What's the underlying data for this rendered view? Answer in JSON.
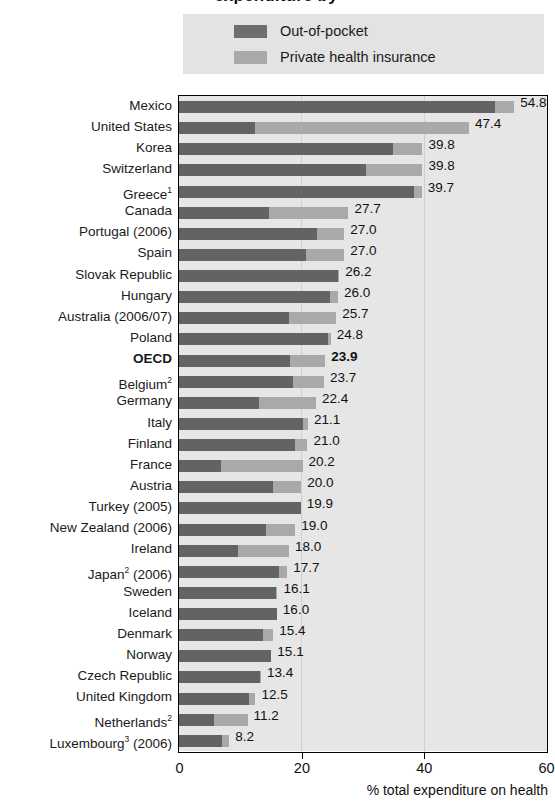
{
  "title": "expenditure by",
  "legend": {
    "position": "top",
    "items": [
      {
        "label": "Out-of-pocket",
        "color": "#636363",
        "icon": "legend-swatch"
      },
      {
        "label": "Private health insurance",
        "color": "#a9a9a9",
        "icon": "legend-swatch"
      }
    ]
  },
  "axis": {
    "xlabel": "% total expenditure on health",
    "ticks": [
      "0",
      "20",
      "40",
      "60"
    ],
    "xmin": 0,
    "xmax": 60
  },
  "chart_data": {
    "type": "bar",
    "orientation": "horizontal",
    "stacked": true,
    "title": "expenditure by",
    "xlabel": "% total expenditure on health",
    "ylabel": "",
    "xlim": [
      0,
      60
    ],
    "grid": true,
    "legend_position": "top",
    "series": [
      {
        "name": "Out-of-pocket",
        "color": "#636363"
      },
      {
        "name": "Private health insurance",
        "color": "#a9a9a9"
      }
    ],
    "categories": [
      "Mexico",
      "United States",
      "Korea",
      "Switzerland",
      "Greece¹",
      "Canada",
      "Portugal (2006)",
      "Spain",
      "Slovak Republic",
      "Hungary",
      "Australia (2006/07)",
      "Poland",
      "OECD",
      "Belgium²",
      "Germany",
      "Italy",
      "Finland",
      "France",
      "Austria",
      "Turkey (2005)",
      "New Zealand (2006)",
      "Ireland",
      "Japan² (2006)",
      "Sweden",
      "Iceland",
      "Denmark",
      "Norway",
      "Czech Republic",
      "United Kingdom",
      "Netherlands²",
      "Luxembourg³ (2006)"
    ],
    "rows": [
      {
        "label": "Mexico",
        "label_html": "Mexico",
        "out_of_pocket": 51.7,
        "private_insurance": 3.1,
        "total": "54.8",
        "bold": false
      },
      {
        "label": "United States",
        "label_html": "United States",
        "out_of_pocket": 12.5,
        "private_insurance": 34.9,
        "total": "47.4",
        "bold": false
      },
      {
        "label": "Korea",
        "label_html": "Korea",
        "out_of_pocket": 35.0,
        "private_insurance": 4.8,
        "total": "39.8",
        "bold": false
      },
      {
        "label": "Switzerland",
        "label_html": "Switzerland",
        "out_of_pocket": 30.5,
        "private_insurance": 9.3,
        "total": "39.8",
        "bold": false
      },
      {
        "label": "Greece1",
        "label_html": "Greece<sup>1</sup>",
        "out_of_pocket": 38.4,
        "private_insurance": 1.3,
        "total": "39.7",
        "bold": false
      },
      {
        "label": "Canada",
        "label_html": "Canada",
        "out_of_pocket": 14.7,
        "private_insurance": 13.0,
        "total": "27.7",
        "bold": false
      },
      {
        "label": "Portugal (2006)",
        "label_html": "Portugal (2006)",
        "out_of_pocket": 22.5,
        "private_insurance": 4.5,
        "total": "27.0",
        "bold": false
      },
      {
        "label": "Spain",
        "label_html": "Spain",
        "out_of_pocket": 20.7,
        "private_insurance": 6.3,
        "total": "27.0",
        "bold": false
      },
      {
        "label": "Slovak Republic",
        "label_html": "Slovak Republic",
        "out_of_pocket": 26.0,
        "private_insurance": 0.2,
        "total": "26.2",
        "bold": false
      },
      {
        "label": "Hungary",
        "label_html": "Hungary",
        "out_of_pocket": 24.7,
        "private_insurance": 1.3,
        "total": "26.0",
        "bold": false
      },
      {
        "label": "Australia (2006/07)",
        "label_html": "Australia (2006/07)",
        "out_of_pocket": 18.0,
        "private_insurance": 7.7,
        "total": "25.7",
        "bold": false
      },
      {
        "label": "Poland",
        "label_html": "Poland",
        "out_of_pocket": 24.3,
        "private_insurance": 0.5,
        "total": "24.8",
        "bold": false
      },
      {
        "label": "OECD",
        "label_html": "OECD",
        "out_of_pocket": 18.2,
        "private_insurance": 5.7,
        "total": "23.9",
        "bold": true
      },
      {
        "label": "Belgium2",
        "label_html": "Belgium<sup>2</sup>",
        "out_of_pocket": 18.6,
        "private_insurance": 5.1,
        "total": "23.7",
        "bold": false
      },
      {
        "label": "Germany",
        "label_html": "Germany",
        "out_of_pocket": 13.1,
        "private_insurance": 9.3,
        "total": "22.4",
        "bold": false
      },
      {
        "label": "Italy",
        "label_html": "Italy",
        "out_of_pocket": 20.3,
        "private_insurance": 0.8,
        "total": "21.1",
        "bold": false
      },
      {
        "label": "Finland",
        "label_html": "Finland",
        "out_of_pocket": 19.0,
        "private_insurance": 2.0,
        "total": "21.0",
        "bold": false
      },
      {
        "label": "France",
        "label_html": "France",
        "out_of_pocket": 6.8,
        "private_insurance": 13.4,
        "total": "20.2",
        "bold": false
      },
      {
        "label": "Austria",
        "label_html": "Austria",
        "out_of_pocket": 15.4,
        "private_insurance": 4.6,
        "total": "20.0",
        "bold": false
      },
      {
        "label": "Turkey (2005)",
        "label_html": "Turkey (2005)",
        "out_of_pocket": 19.9,
        "private_insurance": 0.0,
        "total": "19.9",
        "bold": false
      },
      {
        "label": "New Zealand (2006)",
        "label_html": "New Zealand (2006)",
        "out_of_pocket": 14.3,
        "private_insurance": 4.7,
        "total": "19.0",
        "bold": false
      },
      {
        "label": "Ireland",
        "label_html": "Ireland",
        "out_of_pocket": 9.6,
        "private_insurance": 8.4,
        "total": "18.0",
        "bold": false
      },
      {
        "label": "Japan2 (2006)",
        "label_html": "Japan<sup>2</sup> (2006)",
        "out_of_pocket": 16.4,
        "private_insurance": 1.3,
        "total": "17.7",
        "bold": false
      },
      {
        "label": "Sweden",
        "label_html": "Sweden",
        "out_of_pocket": 15.9,
        "private_insurance": 0.2,
        "total": "16.1",
        "bold": false
      },
      {
        "label": "Iceland",
        "label_html": "Iceland",
        "out_of_pocket": 16.0,
        "private_insurance": 0.0,
        "total": "16.0",
        "bold": false
      },
      {
        "label": "Denmark",
        "label_html": "Denmark",
        "out_of_pocket": 13.8,
        "private_insurance": 1.6,
        "total": "15.4",
        "bold": false
      },
      {
        "label": "Norway",
        "label_html": "Norway",
        "out_of_pocket": 15.1,
        "private_insurance": 0.0,
        "total": "15.1",
        "bold": false
      },
      {
        "label": "Czech Republic",
        "label_html": "Czech Republic",
        "out_of_pocket": 13.2,
        "private_insurance": 0.2,
        "total": "13.4",
        "bold": false
      },
      {
        "label": "United Kingdom",
        "label_html": "United Kingdom",
        "out_of_pocket": 11.4,
        "private_insurance": 1.1,
        "total": "12.5",
        "bold": false
      },
      {
        "label": "Netherlands2",
        "label_html": "Netherlands<sup>2</sup>",
        "out_of_pocket": 5.7,
        "private_insurance": 5.5,
        "total": "11.2",
        "bold": false
      },
      {
        "label": "Luxembourg3 (2006)",
        "label_html": "Luxembourg<sup>3</sup> (2006)",
        "out_of_pocket": 7.0,
        "private_insurance": 1.2,
        "total": "8.2",
        "bold": false
      }
    ]
  }
}
